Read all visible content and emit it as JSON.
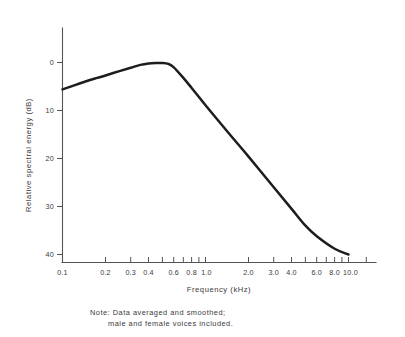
{
  "figure": {
    "background_color": "#ffffff",
    "ink_color": "#1d1d1d",
    "axis_color": "#555555"
  },
  "note": {
    "line1": "Note: Data averaged and smoothed;",
    "line2": "male and female voices included."
  },
  "chart_data": {
    "type": "line",
    "title": "",
    "subtitle": "",
    "xlabel": "Frequency  (kHz)",
    "ylabel": "Relative spectral energy  (dB)",
    "xscale": "log",
    "xlim": [
      0.1,
      13.0
    ],
    "ylim": [
      -44,
      4
    ],
    "grid": false,
    "legend": "none",
    "annotations": [
      "Note: Data averaged and smoothed;",
      "male and female voices included."
    ],
    "xticks": [
      0.1,
      0.2,
      0.3,
      0.4,
      0.5,
      0.6,
      0.7,
      0.8,
      0.9,
      1.0,
      2.0,
      3.0,
      4.0,
      5.0,
      6.0,
      7.0,
      8.0,
      9.0,
      10.0,
      11.0,
      12.0
    ],
    "xtick_labels": [
      {
        "value": 0.1,
        "label": "0.1"
      },
      {
        "value": 0.2,
        "label": "0.2"
      },
      {
        "value": 0.3,
        "label": "0.3"
      },
      {
        "value": 0.4,
        "label": "0.4"
      },
      {
        "value": 0.6,
        "label": "0.6"
      },
      {
        "value": 0.8,
        "label": "0.8"
      },
      {
        "value": 1.0,
        "label": "1.0"
      },
      {
        "value": 2.0,
        "label": "2.0"
      },
      {
        "value": 3.0,
        "label": "3.0"
      },
      {
        "value": 4.0,
        "label": "4.0"
      },
      {
        "value": 6.0,
        "label": "6.0"
      },
      {
        "value": 8.0,
        "label": "8.0"
      },
      {
        "value": 10.0,
        "label": "10.0"
      }
    ],
    "yticks": [
      0,
      -10,
      -20,
      -30,
      -40
    ],
    "ytick_labels": [
      "0",
      "10",
      "20",
      "30",
      "40"
    ],
    "ytick_note": "axis values are negative dB shown without sign",
    "series": [
      {
        "name": "Speech long-term average spectrum",
        "x": [
          0.1,
          0.125,
          0.15,
          0.175,
          0.2,
          0.25,
          0.3,
          0.35,
          0.4,
          0.45,
          0.5,
          0.55,
          0.6,
          0.7,
          0.8,
          0.9,
          1.0,
          1.5,
          2.0,
          3.0,
          4.0,
          5.0,
          6.0,
          8.0,
          10.0
        ],
        "y": [
          -5.6,
          -4.6,
          -3.8,
          -3.2,
          -2.7,
          -1.8,
          -1.1,
          -0.5,
          -0.2,
          -0.1,
          -0.1,
          -0.3,
          -1.0,
          -3.2,
          -5.3,
          -7.2,
          -8.9,
          -15.2,
          -19.6,
          -26.0,
          -30.5,
          -34.0,
          -36.2,
          -38.8,
          -40.0
        ]
      }
    ]
  }
}
